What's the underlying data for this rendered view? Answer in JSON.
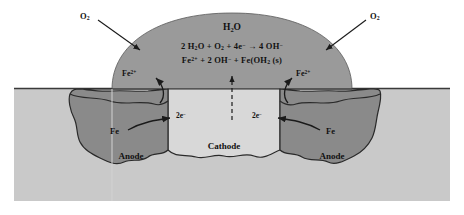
{
  "diagram": {
    "type": "cross-section schematic",
    "colors": {
      "background": "#ffffff",
      "ground": "#c9c9c9",
      "water_droplet": "#9a9a9a",
      "anode_metal": "#8a8a8a",
      "cathode_metal": "#d8d8d8",
      "outline": "#2a2a2a",
      "text": "#111111"
    }
  },
  "labels": {
    "o2_left": "O",
    "o2_left_sub": "2",
    "o2_right": "O",
    "o2_right_sub": "2",
    "water": "H",
    "water_sub": "2",
    "water_tail": "O",
    "fe2_left": "Fe",
    "fe2_left_sup": "2+",
    "fe2_right": "Fe",
    "fe2_right_sup": "2+",
    "fe_left": "Fe",
    "fe_right": "Fe",
    "electrons_left": "2e",
    "electrons_left_sup": "−",
    "electrons_right": "2e",
    "electrons_right_sup": "−",
    "anode_left": "Anode",
    "anode_right": "Anode",
    "cathode": "Cathode"
  },
  "equations": {
    "cathodic": {
      "p1": "2 H",
      "p1sub": "2",
      "p2": "O + O",
      "p2sub": "2",
      "p3": " + 4e",
      "p3sup": "−",
      "p4": " → 4 OH",
      "p4sup": "−"
    },
    "precipitation": {
      "p1": "Fe",
      "p1sup": "2+",
      "p2": " + 2 OH",
      "p2sup": "−",
      "p3": " + Fe(OH",
      "p3sub": "2",
      "p4": " (s)"
    }
  },
  "regions": {
    "droplet_name": "water-droplet",
    "ground_name": "metal-substrate",
    "anode_left_name": "anode-pit-left",
    "anode_right_name": "anode-pit-right",
    "cathode_name": "cathode-region"
  },
  "arrows": {
    "o2_left_flow": "oxygen diffusing into droplet from left",
    "o2_right_flow": "oxygen diffusing into droplet from right",
    "fe2_left_flow": "Fe2+ released into droplet at left anode",
    "fe2_right_flow": "Fe2+ released into droplet at right anode",
    "electron_left_flow": "electrons travel right toward cathode",
    "electron_right_flow": "electrons travel left toward cathode",
    "oh_flow": "hydroxide migration upward (dashed)"
  }
}
